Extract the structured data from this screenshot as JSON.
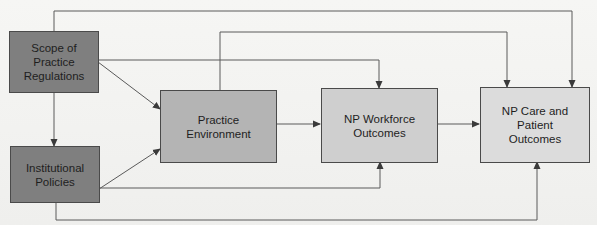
{
  "diagram": {
    "type": "flowchart",
    "nodes": [
      {
        "id": "scope",
        "label": "Scope of Practice Regulations",
        "lines": [
          "Scope of Practice",
          "Regulations"
        ],
        "fill": "#7f7f7f"
      },
      {
        "id": "institutional",
        "label": "Institutional Policies",
        "lines": [
          "Institutional",
          "Policies"
        ],
        "fill": "#7f7f7f"
      },
      {
        "id": "environment",
        "label": "Practice Environment",
        "lines": [
          "Practice Environment"
        ],
        "fill": "#b4b4b4"
      },
      {
        "id": "workforce",
        "label": "NP Workforce Outcomes",
        "lines": [
          "NP Workforce",
          "Outcomes"
        ],
        "fill": "#cfcfcf"
      },
      {
        "id": "care",
        "label": "NP Care and Patient Outcomes",
        "lines": [
          "NP Care and Patient",
          "Outcomes"
        ],
        "fill": "#dcdcdc"
      }
    ],
    "edges": [
      {
        "from": "scope",
        "to": "institutional"
      },
      {
        "from": "scope",
        "to": "environment"
      },
      {
        "from": "scope",
        "to": "workforce"
      },
      {
        "from": "scope",
        "to": "care"
      },
      {
        "from": "institutional",
        "to": "environment"
      },
      {
        "from": "institutional",
        "to": "workforce"
      },
      {
        "from": "institutional",
        "to": "care"
      },
      {
        "from": "environment",
        "to": "workforce"
      },
      {
        "from": "environment",
        "to": "care"
      },
      {
        "from": "workforce",
        "to": "care"
      }
    ],
    "colors": {
      "line": "#5a5a5a",
      "border": "#4a4a4a",
      "background": "#f4f4f2"
    }
  }
}
